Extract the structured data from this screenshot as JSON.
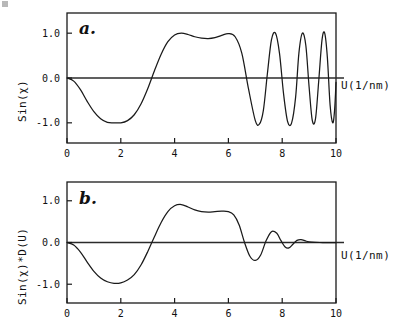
{
  "figure": {
    "background": "#ffffff",
    "curve_color": "#1a1a1a",
    "axis_color": "#2b2b2b"
  },
  "panels": [
    {
      "id": "a.",
      "name": "panel-a",
      "ylabel": "Sin(χ)",
      "xlabel": "U(1/nm)",
      "xticklabels": [
        "0",
        "2",
        "4",
        "6",
        "8",
        "10"
      ],
      "yticklabels": [
        "1.0",
        "0.0",
        "-1.0"
      ]
    },
    {
      "id": "b.",
      "name": "panel-b",
      "ylabel": "Sin(χ)*D(U)",
      "xlabel": "U(1/nm)",
      "xticklabels": [
        "0",
        "2",
        "4",
        "6",
        "8",
        "10"
      ],
      "yticklabels": [
        "1.0",
        "0.0",
        "-1.0"
      ]
    }
  ],
  "chart_data": [
    {
      "type": "line",
      "name": "panel-a",
      "title": "a.",
      "xlabel": "U(1/nm)",
      "ylabel": "Sin(χ)",
      "xlim": [
        0,
        10
      ],
      "ylim": [
        -1.45,
        1.45
      ],
      "xticks": [
        0,
        2,
        4,
        6,
        8,
        10
      ],
      "yticks": [
        -1.0,
        0.0,
        1.0
      ],
      "grid": false,
      "legend": null,
      "series": [
        {
          "name": "Sin(chi)",
          "description": "Undamped contrast transfer function; oscillation frequency increases with spatial frequency U while amplitude stays at full scale +/-1.0",
          "x": [
            0.0,
            0.25,
            0.5,
            0.75,
            1.0,
            1.25,
            1.5,
            1.75,
            2.0,
            2.25,
            2.5,
            2.75,
            3.0,
            3.25,
            3.5,
            3.75,
            4.0,
            4.25,
            4.5,
            4.75,
            5.0,
            5.25,
            5.5,
            5.75,
            6.0,
            6.25,
            6.5,
            6.75,
            7.0,
            7.15,
            7.3,
            7.45,
            7.6,
            7.75,
            7.9,
            8.05,
            8.2,
            8.35,
            8.5,
            8.62,
            8.75,
            8.88,
            9.0,
            9.12,
            9.24,
            9.36,
            9.48,
            9.58,
            9.68,
            9.78,
            9.88,
            9.95,
            10.0
          ],
          "y": [
            0.0,
            -0.07,
            -0.26,
            -0.52,
            -0.75,
            -0.91,
            -0.99,
            -1.0,
            -1.0,
            -0.95,
            -0.82,
            -0.58,
            -0.24,
            0.16,
            0.53,
            0.81,
            0.96,
            1.0,
            0.97,
            0.92,
            0.89,
            0.88,
            0.9,
            0.95,
            0.99,
            0.92,
            0.55,
            -0.25,
            -0.95,
            -1.03,
            -0.72,
            0.1,
            0.85,
            1.0,
            0.55,
            -0.35,
            -0.97,
            -1.0,
            -0.42,
            0.55,
            1.0,
            0.72,
            -0.2,
            -0.95,
            -0.9,
            -0.05,
            0.85,
            1.0,
            0.45,
            -0.6,
            -1.0,
            -0.7,
            -0.1
          ]
        }
      ]
    },
    {
      "type": "line",
      "name": "panel-b",
      "title": "b.",
      "xlabel": "U(1/nm)",
      "ylabel": "Sin(χ)*D(U)",
      "xlim": [
        0,
        10
      ],
      "ylim": [
        -1.45,
        1.45
      ],
      "xticks": [
        0,
        2,
        4,
        6,
        8,
        10
      ],
      "yticks": [
        -1.0,
        0.0,
        1.0
      ],
      "grid": false,
      "legend": null,
      "series": [
        {
          "name": "Sin(chi)*D(U)",
          "description": "Contrast transfer function multiplied by the envelope damping function D(U); high-frequency oscillations are attenuated toward zero beyond U~8.5",
          "x": [
            0.0,
            0.25,
            0.5,
            0.75,
            1.0,
            1.25,
            1.5,
            1.75,
            2.0,
            2.25,
            2.5,
            2.75,
            3.0,
            3.25,
            3.5,
            3.75,
            4.0,
            4.25,
            4.5,
            4.75,
            5.0,
            5.25,
            5.5,
            5.75,
            6.0,
            6.2,
            6.4,
            6.6,
            6.8,
            7.0,
            7.2,
            7.4,
            7.6,
            7.8,
            7.95,
            8.1,
            8.25,
            8.4,
            8.55,
            8.7,
            8.9,
            9.1,
            9.4,
            9.7,
            10.0
          ],
          "y": [
            0.0,
            -0.06,
            -0.23,
            -0.47,
            -0.69,
            -0.85,
            -0.94,
            -0.98,
            -0.97,
            -0.9,
            -0.77,
            -0.54,
            -0.22,
            0.14,
            0.48,
            0.74,
            0.88,
            0.91,
            0.85,
            0.78,
            0.74,
            0.73,
            0.74,
            0.75,
            0.74,
            0.66,
            0.42,
            0.0,
            -0.33,
            -0.43,
            -0.3,
            0.04,
            0.26,
            0.22,
            0.05,
            -0.1,
            -0.13,
            -0.04,
            0.05,
            0.07,
            0.03,
            0.01,
            0.0,
            0.0,
            0.0
          ]
        }
      ]
    }
  ]
}
